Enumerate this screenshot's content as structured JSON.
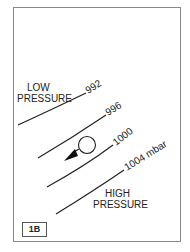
{
  "diagram": {
    "label_low": [
      "LOW",
      "PRESSURE"
    ],
    "label_high": [
      "HIGH",
      "PRESSURE"
    ],
    "isobars": [
      {
        "value": "992"
      },
      {
        "value": "996"
      },
      {
        "value": "1000"
      },
      {
        "value": "1004 mbar"
      }
    ],
    "figure_id": "1B",
    "symbols": [
      "circle",
      "arrow-pointing-down-left"
    ]
  }
}
